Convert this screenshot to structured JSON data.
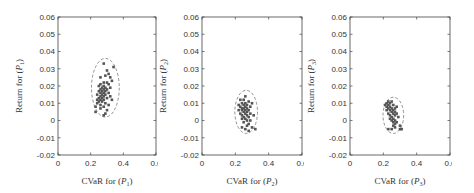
{
  "chart_data": [
    {
      "type": "scatter",
      "title": "",
      "xlabel": "CVaR for (P1)",
      "ylabel": "Return for (P1)",
      "xlim": [
        0,
        0.6
      ],
      "ylim": [
        -0.02,
        0.06
      ],
      "xticks": [
        "0",
        "0.2",
        "0.4",
        "0.6"
      ],
      "yticks": [
        "0.06",
        "0.05",
        "0.04",
        "0.03",
        "0.02",
        "0.01",
        "0",
        "-0.01",
        "-0.02"
      ],
      "ellipse": {
        "cx": 0.29,
        "cy": 0.019,
        "rx": 0.085,
        "ry": 0.017,
        "style": "dashed"
      },
      "points": [
        [
          0.28,
          0.033
        ],
        [
          0.34,
          0.031
        ],
        [
          0.3,
          0.029
        ],
        [
          0.31,
          0.027
        ],
        [
          0.29,
          0.026
        ],
        [
          0.26,
          0.025
        ],
        [
          0.32,
          0.025
        ],
        [
          0.33,
          0.023
        ],
        [
          0.28,
          0.022
        ],
        [
          0.3,
          0.022
        ],
        [
          0.26,
          0.021
        ],
        [
          0.31,
          0.021
        ],
        [
          0.28,
          0.02
        ],
        [
          0.25,
          0.02
        ],
        [
          0.27,
          0.019
        ],
        [
          0.29,
          0.019
        ],
        [
          0.32,
          0.019
        ],
        [
          0.26,
          0.018
        ],
        [
          0.28,
          0.018
        ],
        [
          0.3,
          0.018
        ],
        [
          0.25,
          0.017
        ],
        [
          0.27,
          0.017
        ],
        [
          0.29,
          0.017
        ],
        [
          0.26,
          0.016
        ],
        [
          0.28,
          0.016
        ],
        [
          0.31,
          0.016
        ],
        [
          0.24,
          0.015
        ],
        [
          0.27,
          0.015
        ],
        [
          0.29,
          0.015
        ],
        [
          0.26,
          0.014
        ],
        [
          0.28,
          0.014
        ],
        [
          0.32,
          0.014
        ],
        [
          0.25,
          0.013
        ],
        [
          0.27,
          0.013
        ],
        [
          0.3,
          0.013
        ],
        [
          0.24,
          0.012
        ],
        [
          0.26,
          0.012
        ],
        [
          0.28,
          0.012
        ],
        [
          0.33,
          0.012
        ],
        [
          0.25,
          0.011
        ],
        [
          0.27,
          0.011
        ],
        [
          0.29,
          0.01
        ],
        [
          0.24,
          0.01
        ],
        [
          0.26,
          0.009
        ],
        [
          0.31,
          0.009
        ],
        [
          0.23,
          0.008
        ],
        [
          0.28,
          0.008
        ],
        [
          0.26,
          0.007
        ],
        [
          0.3,
          0.006
        ],
        [
          0.23,
          0.005
        ],
        [
          0.28,
          0.003
        ],
        [
          0.29,
          0.004
        ]
      ]
    },
    {
      "type": "scatter",
      "title": "",
      "xlabel": "CVaR for (P2)",
      "ylabel": "Return for (P2)",
      "xlim": [
        0,
        0.6
      ],
      "ylim": [
        -0.02,
        0.06
      ],
      "xticks": [
        "0",
        "0.2",
        "0.4",
        "0.6"
      ],
      "yticks": [
        "0.06",
        "0.05",
        "0.04",
        "0.03",
        "0.02",
        "0.01",
        "0",
        "-0.01",
        "-0.02"
      ],
      "ellipse": {
        "cx": 0.265,
        "cy": 0.005,
        "rx": 0.068,
        "ry": 0.0125,
        "style": "dashed"
      },
      "points": [
        [
          0.26,
          0.014
        ],
        [
          0.23,
          0.012
        ],
        [
          0.25,
          0.012
        ],
        [
          0.28,
          0.011
        ],
        [
          0.24,
          0.01
        ],
        [
          0.26,
          0.01
        ],
        [
          0.3,
          0.01
        ],
        [
          0.22,
          0.009
        ],
        [
          0.25,
          0.009
        ],
        [
          0.27,
          0.009
        ],
        [
          0.23,
          0.008
        ],
        [
          0.26,
          0.008
        ],
        [
          0.29,
          0.008
        ],
        [
          0.24,
          0.007
        ],
        [
          0.25,
          0.007
        ],
        [
          0.27,
          0.007
        ],
        [
          0.22,
          0.006
        ],
        [
          0.24,
          0.006
        ],
        [
          0.26,
          0.006
        ],
        [
          0.28,
          0.006
        ],
        [
          0.25,
          0.005
        ],
        [
          0.27,
          0.005
        ],
        [
          0.23,
          0.004
        ],
        [
          0.26,
          0.004
        ],
        [
          0.29,
          0.004
        ],
        [
          0.24,
          0.003
        ],
        [
          0.27,
          0.003
        ],
        [
          0.31,
          0.003
        ],
        [
          0.25,
          0.002
        ],
        [
          0.28,
          0.002
        ],
        [
          0.26,
          0.001
        ],
        [
          0.24,
          0.001
        ],
        [
          0.27,
          0.0
        ],
        [
          0.29,
          0.0
        ],
        [
          0.25,
          -0.001
        ],
        [
          0.28,
          -0.002
        ],
        [
          0.27,
          -0.003
        ],
        [
          0.3,
          -0.004
        ],
        [
          0.24,
          -0.004
        ],
        [
          0.26,
          -0.005
        ],
        [
          0.32,
          -0.005
        ],
        [
          0.28,
          -0.006
        ]
      ]
    },
    {
      "type": "scatter",
      "title": "",
      "xlabel": "CVaR for (P3)",
      "ylabel": "Return for (P3)",
      "xlim": [
        0,
        0.6
      ],
      "ylim": [
        -0.02,
        0.06
      ],
      "xticks": [
        "0",
        "0.2",
        "0.4",
        "0.6"
      ],
      "yticks": [
        "0.06",
        "0.05",
        "0.04",
        "0.03",
        "0.02",
        "0.01",
        "0",
        "-0.01",
        "-0.02"
      ],
      "ellipse": {
        "cx": 0.26,
        "cy": 0.003,
        "rx": 0.062,
        "ry": 0.0105,
        "style": "dashed"
      },
      "points": [
        [
          0.23,
          0.011
        ],
        [
          0.25,
          0.011
        ],
        [
          0.22,
          0.01
        ],
        [
          0.24,
          0.01
        ],
        [
          0.21,
          0.009
        ],
        [
          0.23,
          0.009
        ],
        [
          0.26,
          0.009
        ],
        [
          0.22,
          0.008
        ],
        [
          0.24,
          0.008
        ],
        [
          0.28,
          0.008
        ],
        [
          0.23,
          0.007
        ],
        [
          0.25,
          0.007
        ],
        [
          0.27,
          0.007
        ],
        [
          0.22,
          0.006
        ],
        [
          0.24,
          0.006
        ],
        [
          0.26,
          0.006
        ],
        [
          0.25,
          0.005
        ],
        [
          0.27,
          0.005
        ],
        [
          0.23,
          0.004
        ],
        [
          0.26,
          0.004
        ],
        [
          0.28,
          0.004
        ],
        [
          0.24,
          0.003
        ],
        [
          0.27,
          0.003
        ],
        [
          0.25,
          0.002
        ],
        [
          0.29,
          0.002
        ],
        [
          0.26,
          0.001
        ],
        [
          0.24,
          0.001
        ],
        [
          0.27,
          0.0
        ],
        [
          0.25,
          0.0
        ],
        [
          0.28,
          -0.001
        ],
        [
          0.26,
          -0.001
        ],
        [
          0.27,
          -0.002
        ],
        [
          0.3,
          -0.003
        ],
        [
          0.26,
          -0.003
        ],
        [
          0.27,
          -0.004
        ],
        [
          0.23,
          -0.005
        ],
        [
          0.25,
          -0.005
        ],
        [
          0.3,
          -0.005
        ],
        [
          0.31,
          -0.005
        ]
      ]
    }
  ],
  "panels": [
    {
      "xlabel_prefix": "CVaR for (",
      "ylabel_prefix": "Return for (",
      "subscript": "1"
    },
    {
      "xlabel_prefix": "CVaR for (",
      "ylabel_prefix": "Return for (",
      "subscript": "2"
    },
    {
      "xlabel_prefix": "CVaR for (",
      "ylabel_prefix": "Return for (",
      "subscript": "3"
    }
  ],
  "colors": {
    "points": "#555555",
    "axes": "#444444",
    "ellipse": "#777777"
  }
}
